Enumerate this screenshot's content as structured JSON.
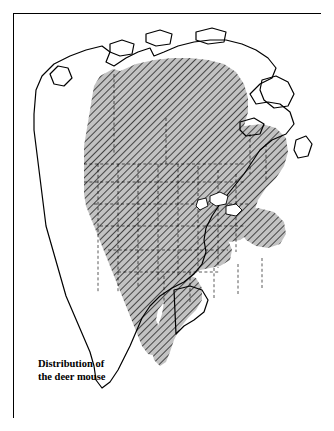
{
  "figure": {
    "type": "distribution-map",
    "region": "North America",
    "caption_line1": "Distribution of",
    "caption_line2": "the deer mouse",
    "caption_full": "Distribution of the deer mouse",
    "border_color": "#000000",
    "background_color": "#ffffff",
    "coastline_color": "#000000",
    "range_fill_color": "#b8b8b8",
    "range_hatch_color": "#000000",
    "internal_boundary_style": "dashed",
    "internal_boundary_color": "#000000"
  },
  "legend": {
    "range_label": "Distribution of the deer mouse",
    "shading_meaning": "hatched gray area = species range"
  }
}
